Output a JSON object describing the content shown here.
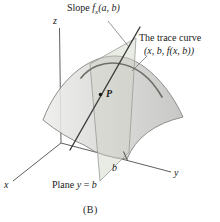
{
  "figure": {
    "caption": "(B)",
    "labels": {
      "slope": {
        "prefix": "Slope ",
        "fvar": "f",
        "fsub": "x",
        "args": "(a, b)"
      },
      "trace_line1": "The trace curve",
      "trace_line2": "(x, b, f(x, b))",
      "plane": {
        "prefix": "Plane ",
        "var": "y",
        "eq": " = ",
        "val": "b"
      },
      "axis_x": "x",
      "axis_y": "y",
      "axis_z": "z",
      "tick_b": "b",
      "point_p": "P"
    },
    "colors": {
      "background": "#ffffff",
      "surface_light": "#ededeb",
      "surface_mid": "#d8d8d6",
      "surface_dark": "#c0c0be",
      "surface_edge": "#8f8f8d",
      "plane_fill": "rgba(206,211,197,0.45)",
      "plane_edge": "#9a9a95",
      "trace_curve": "#6f6f68",
      "tangent_line": "#3d3d3b",
      "axis": "#4d4d4b",
      "leader": "#6a6a68",
      "text": "#1a1a1a"
    }
  }
}
